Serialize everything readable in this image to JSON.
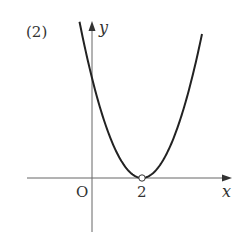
{
  "problem_label": "(2)",
  "chart_data": {
    "type": "line",
    "title": "",
    "function": "y = (x - 2)^2",
    "xlabel": "x",
    "ylabel": "y",
    "origin_label": "O",
    "tick_labels": [
      {
        "axis": "x",
        "value": 2,
        "label": "2"
      }
    ],
    "special_points": [
      {
        "x": 2,
        "y": 0,
        "style": "open-circle",
        "label": "2"
      }
    ],
    "x": [
      -0.5,
      0,
      1,
      2,
      3,
      4,
      4.4
    ],
    "values": [
      6.25,
      4,
      1,
      0,
      1,
      4,
      5.76
    ],
    "xlim": [
      -2.6,
      5.6
    ],
    "ylim": [
      -2.2,
      6.3
    ],
    "grid": false,
    "legend": null
  },
  "colors": {
    "curve": "#222222",
    "axis": "#666666",
    "text": "#333333"
  }
}
